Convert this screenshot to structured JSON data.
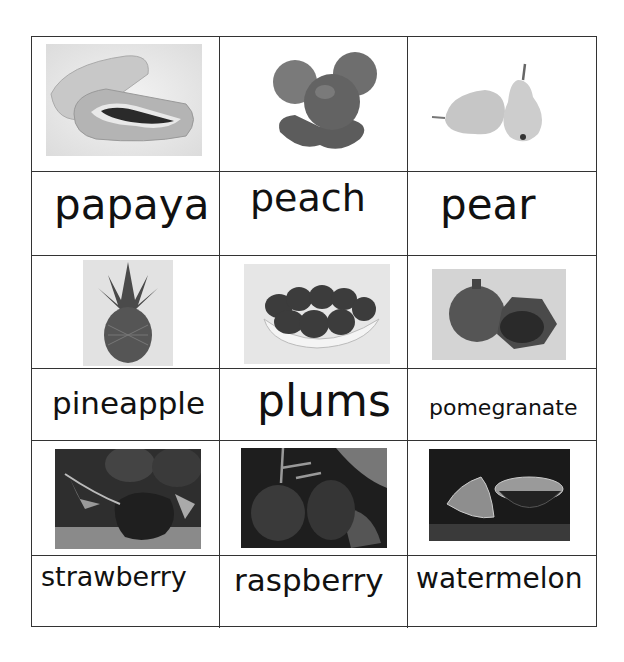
{
  "worksheet": {
    "cards": [
      {
        "fruit": "papaya",
        "image_icon": "papaya-image"
      },
      {
        "fruit": "peach",
        "image_icon": "peach-image"
      },
      {
        "fruit": "pear",
        "image_icon": "pear-image"
      },
      {
        "fruit": "pineapple",
        "image_icon": "pineapple-image"
      },
      {
        "fruit": "plums",
        "image_icon": "plums-image"
      },
      {
        "fruit": "pomegranate",
        "image_icon": "pomegranate-image"
      },
      {
        "fruit": "strawberry",
        "image_icon": "strawberry-image"
      },
      {
        "fruit": "raspberry",
        "image_icon": "raspberry-image"
      },
      {
        "fruit": "watermelon",
        "image_icon": "watermelon-image"
      }
    ]
  }
}
